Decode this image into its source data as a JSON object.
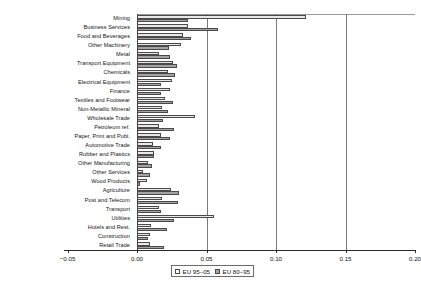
{
  "chart_data": {
    "type": "bar",
    "orientation": "horizontal",
    "title": "",
    "xlabel": "",
    "ylabel": "",
    "xlim": [
      -0.05,
      0.2
    ],
    "xticks": [
      -0.05,
      0.0,
      0.05,
      0.1,
      0.15,
      0.2
    ],
    "xticklabels": [
      "−0.05",
      "0.00",
      "0.05",
      "0.10",
      "0.15",
      "0.20"
    ],
    "grid": "vertical gridlines at 0.05, 0.10, 0.15",
    "legend_position": "bottom-center",
    "categories": [
      "Mining",
      "Business Services",
      "Food and Beverages",
      "Other Machinery",
      "Metal",
      "Transport Equipment",
      "Chemicals",
      "Electrical Equipment",
      "Finance",
      "Textiles and Footwear",
      "Non-Metallic Mineral",
      "Wholesale Trade",
      "Petroleum ref.",
      "Paper, Print and Publ.",
      "Automotive Trade",
      "Rubber and Plastics",
      "Other Manufacturing",
      "Other Services",
      "Wood Products",
      "Agriculture",
      "Post and Telecom",
      "Transport",
      "Utilities",
      "Hotels and Rest.",
      "Construction",
      "Retail Trade"
    ],
    "series": [
      {
        "name": "EU 95–05",
        "swatch": "light",
        "color": "#e8e8e8",
        "values": [
          0.1215,
          0.0365,
          0.033,
          0.0315,
          0.0155,
          0.026,
          0.0225,
          0.0255,
          0.024,
          0.02,
          0.018,
          0.042,
          0.0155,
          0.017,
          0.0115,
          0.012,
          0.008,
          0.0045,
          0.0075,
          0.0245,
          0.018,
          0.016,
          0.0555,
          0.01,
          0.0095,
          0.009
        ]
      },
      {
        "name": "EU 80–95",
        "swatch": "dark",
        "color": "#a3a3a3",
        "values": [
          0.037,
          0.058,
          0.039,
          0.023,
          0.0235,
          0.029,
          0.0275,
          0.0175,
          0.0175,
          0.026,
          0.0225,
          0.019,
          0.0265,
          0.0235,
          0.0175,
          0.012,
          0.0105,
          0.0095,
          0.002,
          0.03,
          0.0295,
          0.0175,
          0.0265,
          0.0215,
          0.008,
          0.0195
        ]
      }
    ]
  },
  "legend": {
    "items": [
      {
        "label": "EU 95–05",
        "swatch": "light"
      },
      {
        "label": "EU 80–95",
        "swatch": "dark"
      }
    ]
  }
}
